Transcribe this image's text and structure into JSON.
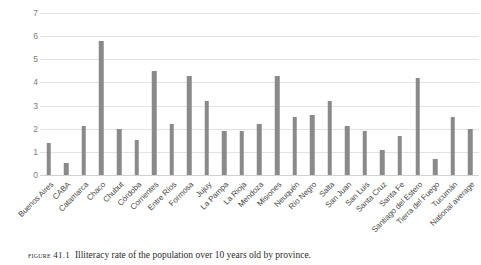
{
  "caption": {
    "figure_label": "FIGURE 41.1",
    "text": "Illiteracy rate of the population over 10 years old by province."
  },
  "style": {
    "bar_color": "#8a8a8a",
    "gridline_color": "#e2e2e2",
    "tick_label_color": "#7d7d7d",
    "axis_label_color": "#4a4a4a",
    "background": "#ffffff"
  },
  "chart_data": {
    "type": "bar",
    "title": "",
    "subtitle": "",
    "xlabel": "",
    "ylabel": "",
    "ylim": [
      0,
      7
    ],
    "yticks": [
      0,
      1,
      2,
      3,
      4,
      5,
      6,
      7
    ],
    "ytick_labels": [
      "0",
      "1",
      "2",
      "3",
      "4",
      "5",
      "6",
      "7"
    ],
    "grid": true,
    "legend": false,
    "legend_position": "none",
    "categories": [
      "Buenos Aires",
      "CABA",
      "Catamarca",
      "Chaco",
      "Chubut",
      "Córdoba",
      "Corrientes",
      "Entre Ríos",
      "Formosa",
      "Jujuy",
      "La Pampa",
      "La Rioja",
      "Mendoza",
      "Misiones",
      "Neuquén",
      "Río Negro",
      "Salta",
      "San Juan",
      "San Luis",
      "Santa Cruz",
      "Santa Fe",
      "Santiago del Estero",
      "Tierra del Fuego",
      "Tucumán",
      "National average"
    ],
    "values": [
      1.4,
      0.5,
      2.1,
      5.8,
      2.0,
      1.5,
      4.5,
      2.2,
      4.3,
      3.2,
      1.9,
      1.9,
      2.2,
      4.3,
      2.5,
      2.6,
      3.2,
      2.1,
      1.9,
      1.1,
      1.7,
      4.2,
      0.7,
      2.5,
      2.0
    ]
  }
}
